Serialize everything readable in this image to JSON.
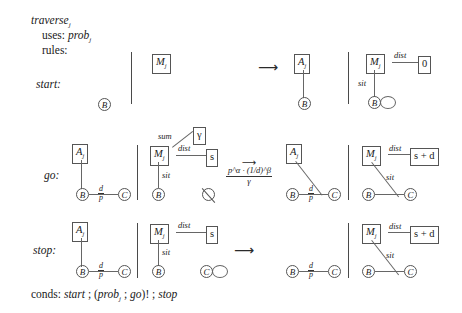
{
  "header": {
    "name": "traverse",
    "name_sub": "j",
    "uses_label": "uses:",
    "uses_value": "prob",
    "uses_value_sub": "j",
    "rules_label": "rules:"
  },
  "conds": {
    "label": "conds:",
    "expression": "start ; (probⱼ ; go)! ; stop",
    "parts": [
      "start",
      ";",
      "(",
      "prob",
      "j",
      ";",
      "go",
      ")!",
      ";",
      "stop"
    ]
  },
  "rows": [
    {
      "id": "start",
      "label": "start:",
      "lhs": {
        "node_b": "B"
      },
      "rhs": {
        "box_a": "A",
        "box_a_sub": "j",
        "node_b": "B"
      },
      "effect": {
        "box_m": "M",
        "box_m_sub": "j",
        "edge_dist": "dist",
        "box_dist_value": "0",
        "edge_sit": "sit",
        "node_b": "B",
        "has_self_loop": true
      }
    },
    {
      "id": "go",
      "label": "go:",
      "lhs": {
        "box_a": "A",
        "box_a_sub": "j",
        "node_b": "B",
        "node_c": "C",
        "edge_label_num": "d",
        "edge_label_den": "p"
      },
      "mid": {
        "box_m": "M",
        "box_m_sub": "j",
        "edge_sum": "sum",
        "box_sum_value": "γ",
        "edge_dist": "dist",
        "box_dist_value": "s",
        "edge_sit": "sit",
        "node_b": "B",
        "null_symbol": "⌀"
      },
      "transition": {
        "arrow": "⟶",
        "numerator": "pᵅ·(₁⁄ₑ)ᵝ",
        "numerator_plain": "p^α · (1/d)^β",
        "denominator": "γ"
      },
      "rhs": {
        "box_a": "A",
        "box_a_sub": "j",
        "node_b": "B",
        "node_c": "C",
        "edge_label_num": "d",
        "edge_label_den": "p"
      },
      "effect": {
        "box_m": "M",
        "box_m_sub": "j",
        "edge_dist": "dist",
        "box_dist_value": "s + d",
        "edge_sit": "sit",
        "node_b": "B",
        "node_c": "C"
      }
    },
    {
      "id": "stop",
      "label": "stop:",
      "lhs": {
        "box_a": "A",
        "box_a_sub": "j",
        "node_b": "B",
        "node_c": "C",
        "edge_label_num": "d",
        "edge_label_den": "p"
      },
      "mid": {
        "box_m": "M",
        "box_m_sub": "j",
        "edge_dist": "dist",
        "box_dist_value": "s",
        "edge_sit": "sit",
        "node_b": "B",
        "node_c": "C",
        "node_c_self_loop": true
      },
      "transition": {
        "arrow": "⟶"
      },
      "rhs": {
        "node_b": "B",
        "node_c": "C",
        "edge_label_num": "d",
        "edge_label_den": "p"
      },
      "effect": {
        "box_m": "M",
        "box_m_sub": "j",
        "edge_dist": "dist",
        "box_dist_value": "s + d",
        "edge_sit": "sit",
        "node_b": "B",
        "node_c": "C"
      }
    }
  ]
}
